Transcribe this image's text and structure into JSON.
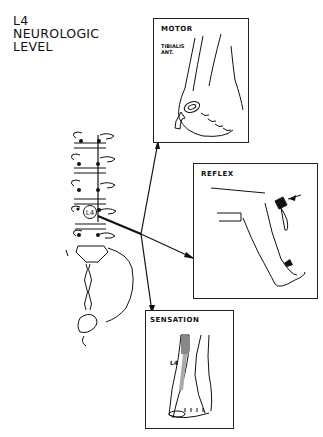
{
  "title": {
    "lines": [
      "L4",
      "NEUROLOGIC",
      "LEVEL"
    ]
  },
  "spine": {
    "level_label": "L4"
  },
  "panels": {
    "motor": {
      "label": "MOTOR",
      "muscle_line1": "TIBIALIS",
      "muscle_line2": "ANT."
    },
    "reflex": {
      "label": "REFLEX"
    },
    "sensation": {
      "label": "SENSATION",
      "dermatome_label": "L4"
    }
  },
  "colors": {
    "ink": "#111111",
    "background": "#ffffff"
  }
}
